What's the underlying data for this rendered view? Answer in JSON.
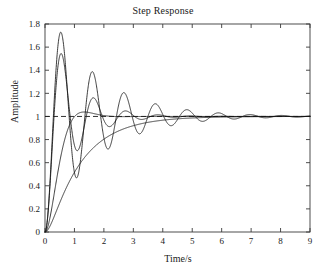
{
  "figure": {
    "title": "Step Response",
    "xlabel": "Time/s",
    "ylabel": "Amplitude",
    "background": "#ffffff",
    "line_color": "#1a1a1a",
    "axis_color": "#3a3a3a"
  },
  "chart_data": {
    "type": "line",
    "title": "Step Response",
    "xlabel": "Time/s",
    "ylabel": "Amplitude",
    "xlim": [
      0,
      9
    ],
    "ylim": [
      0,
      1.8
    ],
    "xticks": [
      "0",
      "1",
      "2",
      "3",
      "4",
      "5",
      "6",
      "7",
      "8",
      "9"
    ],
    "yticks": [
      "0",
      "0.2",
      "0.4",
      "0.6",
      "0.8",
      "1",
      "1.2",
      "1.4",
      "1.6",
      "1.8"
    ],
    "grid": false,
    "legend": "none",
    "annotations": [
      {
        "name": "steady-state-reference",
        "type": "hline",
        "y": 1.0,
        "style": "dashed"
      }
    ],
    "series": [
      {
        "name": "lightly-damped",
        "style": "solid",
        "model": {
          "type": "second-order-step",
          "zeta": 0.1,
          "wn": 5.9
        },
        "peaks": [
          {
            "t": 0.53,
            "y": 1.72
          },
          {
            "t": 1.59,
            "y": 1.38
          },
          {
            "t": 2.66,
            "y": 1.2
          },
          {
            "t": 3.72,
            "y": 1.11
          },
          {
            "t": 4.78,
            "y": 1.07
          },
          {
            "t": 5.85,
            "y": 1.04
          }
        ],
        "troughs": [
          {
            "t": 1.06,
            "y": 0.47
          },
          {
            "t": 2.12,
            "y": 0.71
          },
          {
            "t": 3.19,
            "y": 0.84
          },
          {
            "t": 4.25,
            "y": 0.91
          }
        ]
      },
      {
        "name": "moderately-damped",
        "style": "solid",
        "model": {
          "type": "second-order-step",
          "zeta": 0.19,
          "wn": 5.85
        },
        "peaks": [
          {
            "t": 0.56,
            "y": 1.52
          },
          {
            "t": 1.63,
            "y": 1.15
          },
          {
            "t": 2.7,
            "y": 1.05
          }
        ],
        "troughs": [
          {
            "t": 1.1,
            "y": 0.72
          },
          {
            "t": 2.17,
            "y": 0.93
          }
        ]
      },
      {
        "name": "near-critically-damped",
        "style": "solid",
        "model": {
          "type": "second-order-step",
          "zeta": 0.72,
          "wn": 3.4
        },
        "peaks": [
          {
            "t": 1.32,
            "y": 1.035
          }
        ],
        "troughs": []
      },
      {
        "name": "overdamped",
        "style": "solid",
        "model": {
          "type": "second-order-step",
          "zeta": 1.45,
          "wn": 2.25
        },
        "peaks": [],
        "troughs": []
      }
    ]
  }
}
